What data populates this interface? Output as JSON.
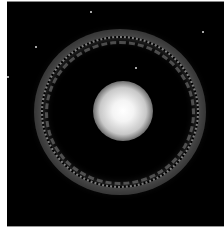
{
  "image": {
    "subject": "ring galaxy with bright central nucleus",
    "colors": {
      "background": "#000000",
      "core": "#ffffff",
      "ring": "#bfbfbf",
      "border": "#ffffff"
    }
  }
}
